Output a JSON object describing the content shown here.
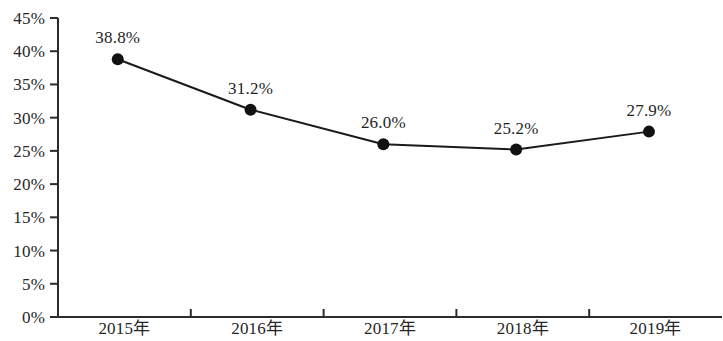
{
  "chart_data": {
    "type": "line",
    "title": "",
    "subtitle": "",
    "xlabel": "",
    "ylabel": "",
    "categories": [
      "2015年",
      "2016年",
      "2017年",
      "2018年",
      "2019年"
    ],
    "values": [
      38.8,
      31.2,
      26.0,
      25.2,
      27.9
    ],
    "point_labels": [
      "38.8%",
      "31.2%",
      "26.0%",
      "25.2%",
      "27.9%"
    ],
    "ylim": [
      0,
      45
    ],
    "ytick_step": 5,
    "ytick_labels": [
      "0%",
      "5%",
      "10%",
      "15%",
      "20%",
      "25%",
      "30%",
      "35%",
      "40%",
      "45%"
    ],
    "ytick_values": [
      0,
      5,
      10,
      15,
      20,
      25,
      30,
      35,
      40,
      45
    ],
    "grid": false,
    "legend": null,
    "legend_position": "none",
    "series": [
      {
        "name": "",
        "values": [
          38.8,
          31.2,
          26.0,
          25.2,
          27.9
        ],
        "marker": "filled-circle",
        "color": "#111111",
        "line_color": "#1a1a1a",
        "line_width": 2
      }
    ],
    "annotations": []
  },
  "axes": {
    "y_axis_color": "#2b2b2b",
    "x_axis_color": "#2b2b2b",
    "tick_direction": "outside"
  },
  "colors": {
    "background": "#ffffff",
    "text": "#262626",
    "marker": "#111111",
    "line": "#1a1a1a"
  }
}
